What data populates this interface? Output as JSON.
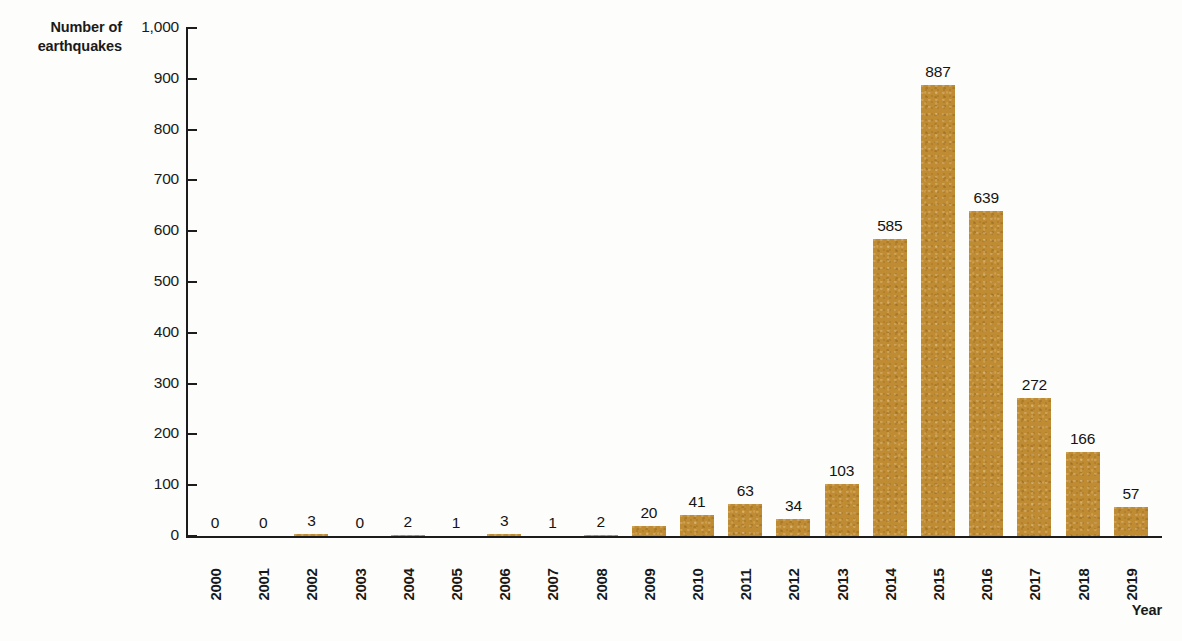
{
  "chart_data": {
    "type": "bar",
    "title": "",
    "xlabel": "Year",
    "ylabel": "Number of\nearthquakes",
    "categories": [
      "2000",
      "2001",
      "2002",
      "2003",
      "2004",
      "2005",
      "2006",
      "2007",
      "2008",
      "2009",
      "2010",
      "2011",
      "2012",
      "2013",
      "2014",
      "2015",
      "2016",
      "2017",
      "2018",
      "2019"
    ],
    "values": [
      0,
      0,
      3,
      0,
      2,
      1,
      3,
      1,
      2,
      20,
      41,
      63,
      34,
      103,
      585,
      887,
      639,
      272,
      166,
      57
    ],
    "value_labels": [
      "0",
      "0",
      "3",
      "0",
      "2",
      "1",
      "3",
      "1",
      "2",
      "20",
      "41",
      "63",
      "34",
      "103",
      "585",
      "887",
      "639",
      "272",
      "166",
      "57"
    ],
    "ylim": [
      0,
      1000
    ],
    "ytick_values": [
      0,
      100,
      200,
      300,
      400,
      500,
      600,
      700,
      800,
      900,
      1000
    ],
    "ytick_labels": [
      "0",
      "100",
      "200",
      "300",
      "400",
      "500",
      "600",
      "700",
      "800",
      "900",
      "1,000"
    ],
    "grid": false,
    "legend": false,
    "series": [
      {
        "name": "Number of earthquakes",
        "color": "#c08c33",
        "values": [
          0,
          0,
          3,
          0,
          2,
          1,
          3,
          1,
          2,
          20,
          41,
          63,
          34,
          103,
          585,
          887,
          639,
          272,
          166,
          57
        ]
      }
    ],
    "colors": {
      "bar": "#c08c33",
      "axis": "#1c1c1c",
      "text": "#1a1a1a",
      "background": "#fdfdfb"
    }
  }
}
